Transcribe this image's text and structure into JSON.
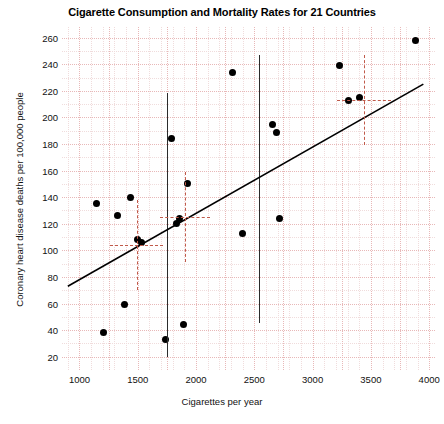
{
  "chart_data": {
    "type": "scatter",
    "title": "Cigarette Consumption and Mortality Rates for 21 Countries",
    "xlabel": "Cigarettes per year",
    "ylabel": "Coronary heart disease deaths per 100,000 people",
    "xlim": [
      850,
      4050
    ],
    "ylim": [
      10,
      268
    ],
    "xticks": [
      1000,
      1500,
      2000,
      2500,
      3000,
      3500,
      4000
    ],
    "yticks": [
      20,
      40,
      60,
      80,
      100,
      120,
      140,
      160,
      180,
      200,
      220,
      240,
      260
    ],
    "grid": true,
    "grid_color": "#e8b8b8",
    "legend": "none",
    "point_color": "#000000",
    "line_color": "#000000",
    "marker_color": "#c05a4a",
    "points": [
      {
        "x": 1145,
        "y": 135
      },
      {
        "x": 1210,
        "y": 38
      },
      {
        "x": 1325,
        "y": 126
      },
      {
        "x": 1390,
        "y": 59
      },
      {
        "x": 1440,
        "y": 140
      },
      {
        "x": 1495,
        "y": 108
      },
      {
        "x": 1530,
        "y": 106
      },
      {
        "x": 1740,
        "y": 33
      },
      {
        "x": 1790,
        "y": 184
      },
      {
        "x": 1830,
        "y": 120
      },
      {
        "x": 1860,
        "y": 124
      },
      {
        "x": 1890,
        "y": 44
      },
      {
        "x": 1930,
        "y": 150
      },
      {
        "x": 2315,
        "y": 234
      },
      {
        "x": 2400,
        "y": 113
      },
      {
        "x": 2660,
        "y": 195
      },
      {
        "x": 2690,
        "y": 189
      },
      {
        "x": 2720,
        "y": 124
      },
      {
        "x": 3230,
        "y": 239
      },
      {
        "x": 3310,
        "y": 213
      },
      {
        "x": 3400,
        "y": 215
      },
      {
        "x": 3880,
        "y": 258
      }
    ],
    "regression_line": {
      "x_start": 900,
      "y_start": 73,
      "x_end": 3950,
      "y_end": 225
    },
    "vertical_reference_lines": [
      {
        "x": 1750,
        "y_top": 218,
        "y_bottom": 20
      },
      {
        "x": 2540,
        "y_top": 247,
        "y_bottom": 45
      }
    ],
    "crosshair_markers": [
      {
        "x": 1490,
        "y": 104,
        "h_half_width": 230,
        "v_half_height": 34
      },
      {
        "x": 1905,
        "y": 125,
        "h_half_width": 215,
        "v_half_height": 34
      },
      {
        "x": 3440,
        "y": 213,
        "h_half_width": 230,
        "v_half_height": 34
      }
    ]
  }
}
